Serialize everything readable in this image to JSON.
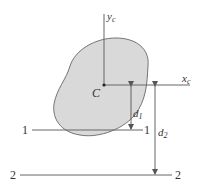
{
  "diagram": {
    "colors": {
      "shape_fill": "#d9d9d9",
      "shape_stroke": "#666666",
      "line": "#666666",
      "text": "#333333"
    },
    "centroid_label": "C",
    "axes": {
      "yc": {
        "base": "y",
        "sub": "c"
      },
      "xc": {
        "base": "x",
        "sub": "c"
      }
    },
    "axis_lines": [
      {
        "left_label": "1",
        "right_label": "1"
      },
      {
        "left_label": "2",
        "right_label": "2"
      }
    ],
    "distances": [
      {
        "base": "d",
        "sub": "1"
      },
      {
        "base": "d",
        "sub": "2"
      }
    ]
  }
}
